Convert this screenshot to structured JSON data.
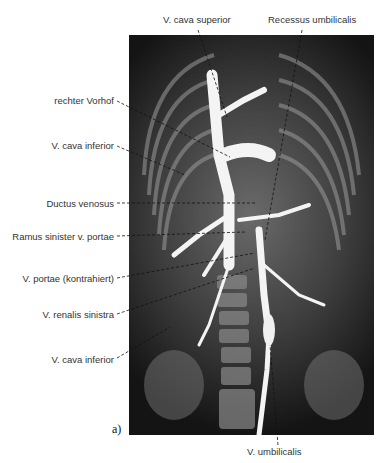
{
  "figure": {
    "panel_label": "a)",
    "image_description": "Angiogram X-ray of neonate thorax and abdomen with contrast-filled veins",
    "labels_top": [
      {
        "text": "V. cava superior",
        "x": 163,
        "y": 14
      },
      {
        "text": "Recessus umbilicalis",
        "x": 268,
        "y": 14
      }
    ],
    "labels_left": [
      {
        "text": "rechter Vorhof",
        "y": 95
      },
      {
        "text": "V. cava inferior",
        "y": 140
      },
      {
        "text": "Ductus venosus",
        "y": 200
      },
      {
        "text": "Ramus sinister v. portae",
        "y": 233
      },
      {
        "text": "V. portae (kontrahiert)",
        "y": 276
      },
      {
        "text": "V. renalis sinistra",
        "y": 311
      },
      {
        "text": "V. cava inferior",
        "y": 357
      }
    ],
    "labels_bottom": [
      {
        "text": "V. umbilicalis",
        "x": 247,
        "y": 448
      }
    ]
  }
}
